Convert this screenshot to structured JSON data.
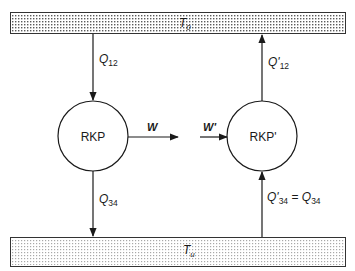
{
  "reservoirs": {
    "hot": {
      "label_main": "T",
      "label_sub": "0"
    },
    "cold": {
      "label_main": "T",
      "label_sub": "u"
    }
  },
  "machines": {
    "left": {
      "label": "RKP"
    },
    "right": {
      "label": "RKP'"
    }
  },
  "flows": {
    "q12": {
      "main": "Q",
      "sub": "12"
    },
    "q34": {
      "main": "Q",
      "sub": "34"
    },
    "q12_prime": {
      "main": "Q'",
      "sub": "12"
    },
    "q34_prime": {
      "main": "Q'",
      "sub": "34",
      "eq": " = ",
      "rhs_main": "Q",
      "rhs_sub": "34"
    },
    "w": {
      "label": "W"
    },
    "w_prime": {
      "label": "W'"
    }
  },
  "colors": {
    "line": "#1a1a1a",
    "hot_dots": "#5a5a5a",
    "cold_dots": "#9a9a9a",
    "bar_fill": "#ffffff"
  }
}
